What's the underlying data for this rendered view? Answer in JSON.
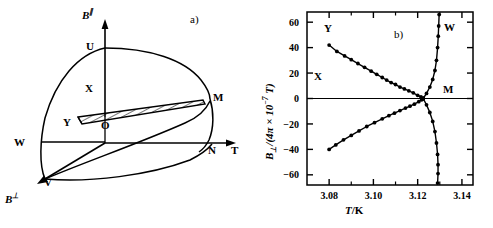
{
  "figure": {
    "panel_a": {
      "part_label": "a)",
      "axis_vertical": "B",
      "axis_vertical_sup": "∥",
      "axis_horizontal": "T",
      "axis_depth": "B",
      "axis_depth_sup": "⊥",
      "origin_label": "O",
      "points": [
        {
          "name": "U",
          "label": "U",
          "x": 86,
          "y": 47
        },
        {
          "name": "X",
          "label": "X",
          "x": 85,
          "y": 89
        },
        {
          "name": "Y",
          "label": "Y",
          "x": 63,
          "y": 120
        },
        {
          "name": "M",
          "label": "M",
          "x": 210,
          "y": 98
        },
        {
          "name": "W",
          "label": "W",
          "x": 16,
          "y": 143
        },
        {
          "name": "V",
          "label": "V",
          "x": 45,
          "y": 180
        },
        {
          "name": "N",
          "label": "N",
          "x": 200,
          "y": 152
        },
        {
          "name": "O",
          "label": "O",
          "x": 105,
          "y": 117
        }
      ],
      "hatched_region_name": "coexistence-surface"
    },
    "panel_b": {
      "part_label": "b)",
      "region_labels": [
        {
          "name": "Y",
          "label": "Y",
          "x": 78,
          "y": 28
        },
        {
          "name": "X",
          "label": "X",
          "x": 66,
          "y": 76
        },
        {
          "name": "W",
          "label": "W",
          "x": 188,
          "y": 28
        },
        {
          "name": "M",
          "label": "M",
          "x": 187,
          "y": 88
        }
      ]
    }
  },
  "chart_data": {
    "type": "line",
    "title": "",
    "xlabel": "T /K",
    "xlabel_italic": "T",
    "xlabel_unit": "/K",
    "ylabel": "B⊥/(4π × 10⁻⁷ T)",
    "ylabel_symbol": "B",
    "ylabel_sub": "⊥",
    "ylabel_rest": "/(4π × 10",
    "ylabel_exp": "−7",
    "ylabel_tail": " T)",
    "xlim": [
      3.07,
      3.145
    ],
    "ylim": [
      -68,
      68
    ],
    "xticks": [
      3.08,
      3.1,
      3.12,
      3.14
    ],
    "xtick_labels": [
      "3.08",
      "3.10",
      "3.12",
      "3.14"
    ],
    "xminorticks": [
      3.09,
      3.11,
      3.13
    ],
    "yticks": [
      60,
      40,
      20,
      0,
      -20,
      -40,
      -60
    ],
    "ytick_labels": [
      "60",
      "40",
      "20",
      "0",
      "−20",
      "−40",
      "−60"
    ],
    "grid": false,
    "legend": "none",
    "zero_line": 0,
    "series": [
      {
        "name": "upper-branch-Y",
        "marker": "filled-circle",
        "x": [
          3.08,
          3.0835,
          3.087,
          3.09,
          3.093,
          3.096,
          3.099,
          3.1015,
          3.104,
          3.106,
          3.108,
          3.11,
          3.112,
          3.114,
          3.116,
          3.118,
          3.12,
          3.1215,
          3.1225
        ],
        "y": [
          42.0,
          37.0,
          33.5,
          30.5,
          27.5,
          24.5,
          21.5,
          19.0,
          16.5,
          14.5,
          12.5,
          11.0,
          9.0,
          7.5,
          6.0,
          4.5,
          2.5,
          1.2,
          0.0
        ]
      },
      {
        "name": "lower-branch-X",
        "marker": "filled-circle",
        "x": [
          3.08,
          3.083,
          3.0865,
          3.09,
          3.0935,
          3.097,
          3.1005,
          3.104,
          3.107,
          3.1095,
          3.112,
          3.1145,
          3.1165,
          3.1185,
          3.1205,
          3.1218,
          3.1225
        ],
        "y": [
          -40.0,
          -36.5,
          -32.5,
          -29.0,
          -25.5,
          -22.0,
          -19.0,
          -16.0,
          -13.5,
          -11.5,
          -9.5,
          -7.5,
          -6.0,
          -4.5,
          -2.5,
          -1.0,
          0.0
        ]
      },
      {
        "name": "vertical-branch-W-upper",
        "marker": "filled-circle",
        "x": [
          3.1225,
          3.124,
          3.1255,
          3.1268,
          3.1278,
          3.1285,
          3.129,
          3.1293,
          3.1295,
          3.1297
        ],
        "y": [
          0.0,
          4.0,
          9.0,
          15.0,
          22.0,
          30.0,
          40.0,
          49.0,
          57.0,
          66.0
        ]
      },
      {
        "name": "vertical-branch-M-lower",
        "marker": "filled-circle",
        "x": [
          3.1225,
          3.124,
          3.1255,
          3.1268,
          3.1278,
          3.1285,
          3.129,
          3.1292,
          3.1292,
          3.129
        ],
        "y": [
          0.0,
          -5.0,
          -11.0,
          -18.0,
          -26.0,
          -35.0,
          -44.0,
          -52.0,
          -59.0,
          -66.5
        ]
      }
    ],
    "convergence_point": {
      "x": 3.1225,
      "y": 0
    }
  }
}
